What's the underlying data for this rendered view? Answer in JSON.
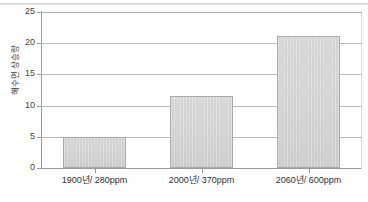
{
  "chart_data": {
    "type": "bar",
    "title": "",
    "xlabel": "",
    "ylabel": "해수면 상승량",
    "categories": [
      "1900년/ 280ppm",
      "2000년/ 370ppm",
      "2060년/ 600ppm"
    ],
    "values": [
      5.0,
      11.5,
      21.2
    ],
    "ylim": [
      0,
      25
    ],
    "ytick_values": [
      0,
      5,
      10,
      15,
      20,
      25
    ],
    "ytick_labels": [
      "0",
      "5",
      "10",
      "15",
      "20",
      "25"
    ],
    "grid": "horizontal",
    "legend": "none",
    "series": [
      {
        "name": "해수면 상승량",
        "values": [
          5.0,
          11.5,
          21.2
        ]
      }
    ],
    "colors": {
      "bar_fill": "#d0d0d0",
      "bar_border": "#a8a8a8",
      "gridline": "#b9b9b9",
      "axis": "#9a9a9a",
      "text": "#3c3c3c",
      "background": "#ffffff"
    }
  }
}
